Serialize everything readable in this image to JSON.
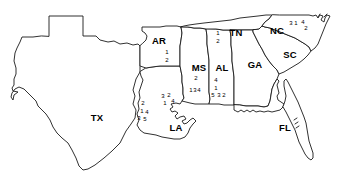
{
  "map": {
    "title": "Southeastern United States outline map with numbered site markers",
    "stroke_color": "#1a1a1a",
    "fill_color": "#ffffff",
    "background_color": "#ffffff",
    "states": [
      {
        "code": "TX",
        "label_x": 97,
        "label_y": 118
      },
      {
        "code": "AR",
        "label_x": 159,
        "label_y": 41
      },
      {
        "code": "LA",
        "label_x": 176,
        "label_y": 128
      },
      {
        "code": "MS",
        "label_x": 199,
        "label_y": 68
      },
      {
        "code": "AL",
        "label_x": 222,
        "label_y": 68
      },
      {
        "code": "TN",
        "label_x": 236,
        "label_y": 33
      },
      {
        "code": "GA",
        "label_x": 255,
        "label_y": 65
      },
      {
        "code": "NC",
        "label_x": 277,
        "label_y": 31
      },
      {
        "code": "SC",
        "label_x": 290,
        "label_y": 55
      },
      {
        "code": "FL",
        "label_x": 285,
        "label_y": 128
      }
    ],
    "markers": [
      {
        "state": "AR",
        "text": "1",
        "x": 167,
        "y": 52
      },
      {
        "state": "AR",
        "text": "2",
        "x": 167,
        "y": 60
      },
      {
        "state": "TN",
        "text": "1",
        "x": 218,
        "y": 33
      },
      {
        "state": "TN",
        "text": "2",
        "x": 218,
        "y": 41
      },
      {
        "state": "NC",
        "text": "3",
        "x": 291,
        "y": 23
      },
      {
        "state": "NC",
        "text": "1",
        "x": 296,
        "y": 23
      },
      {
        "state": "NC",
        "text": "4",
        "x": 303,
        "y": 22
      },
      {
        "state": "NC",
        "text": "2",
        "x": 306,
        "y": 28
      },
      {
        "state": "MS",
        "text": "2",
        "x": 196,
        "y": 78
      },
      {
        "state": "MS",
        "text": "1",
        "x": 191,
        "y": 90
      },
      {
        "state": "MS",
        "text": "3",
        "x": 195,
        "y": 90
      },
      {
        "state": "MS",
        "text": "4",
        "x": 199,
        "y": 90
      },
      {
        "state": "AL",
        "text": "4",
        "x": 216,
        "y": 80
      },
      {
        "state": "AL",
        "text": "1",
        "x": 216,
        "y": 88
      },
      {
        "state": "AL",
        "text": "5",
        "x": 213,
        "y": 95
      },
      {
        "state": "AL",
        "text": "3",
        "x": 219,
        "y": 95
      },
      {
        "state": "AL",
        "text": "2",
        "x": 224,
        "y": 95
      },
      {
        "state": "LA",
        "text": "3",
        "x": 163,
        "y": 96
      },
      {
        "state": "LA",
        "text": "2",
        "x": 169,
        "y": 95
      },
      {
        "state": "LA",
        "text": "1",
        "x": 165,
        "y": 103
      },
      {
        "state": "LA",
        "text": "4",
        "x": 173,
        "y": 101
      },
      {
        "state": "LA",
        "text": "2",
        "x": 143,
        "y": 103
      },
      {
        "state": "LA",
        "text": "1",
        "x": 142,
        "y": 111
      },
      {
        "state": "LA",
        "text": "4",
        "x": 147,
        "y": 112
      },
      {
        "state": "LA",
        "text": "3",
        "x": 139,
        "y": 118
      },
      {
        "state": "LA",
        "text": "5",
        "x": 145,
        "y": 119
      }
    ]
  }
}
